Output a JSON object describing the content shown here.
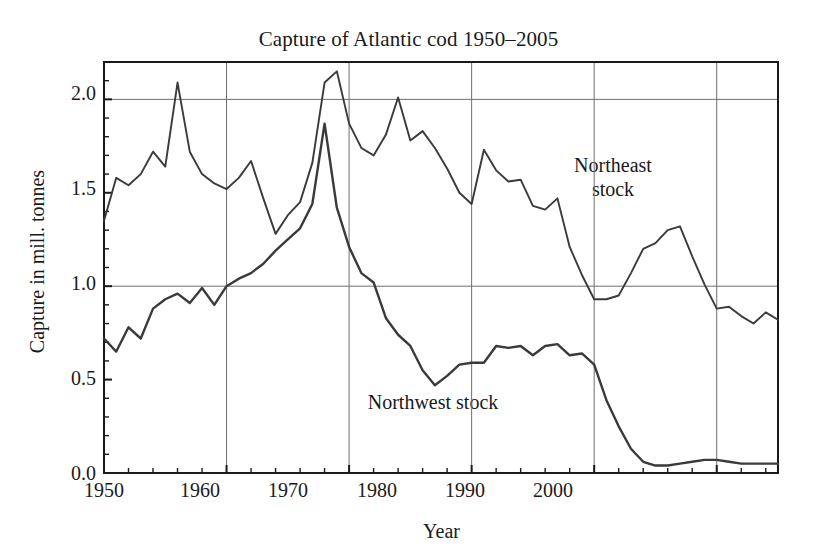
{
  "chart_data": {
    "type": "line",
    "title": "Capture of Atlantic cod 1950–2005",
    "xlabel": "Year",
    "ylabel": "Capture in mill. tonnes",
    "xlim": [
      1950,
      2005
    ],
    "ylim": [
      0.0,
      2.2
    ],
    "xticks": [
      1950,
      1960,
      1970,
      1980,
      1990,
      2000
    ],
    "xticklabels": [
      "1950",
      "1960",
      "1970",
      "1980",
      "1990",
      "2000"
    ],
    "yticks": [
      0.0,
      0.5,
      1.0,
      1.5,
      2.0
    ],
    "yticklabels": [
      "0.0",
      "0.5",
      "1.0",
      "1.5",
      "2.0"
    ],
    "grid": "major gridlines at x = 1960,1970,1980,1990,2000 and y = 1.0,2.0",
    "legend_position": "inline annotations on plot",
    "line_color": "#3a3a3a",
    "frame_color": "#1a1a1a",
    "x": [
      1950,
      1951,
      1952,
      1953,
      1954,
      1955,
      1956,
      1957,
      1958,
      1959,
      1960,
      1961,
      1962,
      1963,
      1964,
      1965,
      1966,
      1967,
      1968,
      1969,
      1970,
      1971,
      1972,
      1973,
      1974,
      1975,
      1976,
      1977,
      1978,
      1979,
      1980,
      1981,
      1982,
      1983,
      1984,
      1985,
      1986,
      1987,
      1988,
      1989,
      1990,
      1991,
      1992,
      1993,
      1994,
      1995,
      1996,
      1997,
      1998,
      1999,
      2000,
      2001,
      2002,
      2003,
      2004,
      2005
    ],
    "series": [
      {
        "name": "Northeast stock",
        "label_text": "Northeast\nstock",
        "values": [
          1.35,
          1.58,
          1.54,
          1.6,
          1.72,
          1.64,
          2.09,
          1.72,
          1.6,
          1.55,
          1.52,
          1.58,
          1.67,
          1.47,
          1.28,
          1.38,
          1.45,
          1.66,
          2.09,
          2.15,
          1.87,
          1.74,
          1.7,
          1.81,
          2.01,
          1.78,
          1.83,
          1.74,
          1.63,
          1.5,
          1.44,
          1.73,
          1.62,
          1.56,
          1.57,
          1.43,
          1.41,
          1.47,
          1.21,
          1.06,
          0.93,
          0.93,
          0.95,
          1.07,
          1.2,
          1.23,
          1.3,
          1.32,
          1.16,
          1.01,
          0.88,
          0.89,
          0.84,
          0.8,
          0.86,
          0.82
        ]
      },
      {
        "name": "Northwest stock",
        "label_text": "Northwest stock",
        "values": [
          0.72,
          0.65,
          0.78,
          0.72,
          0.88,
          0.93,
          0.96,
          0.91,
          0.99,
          0.9,
          1.0,
          1.04,
          1.07,
          1.12,
          1.19,
          1.25,
          1.31,
          1.44,
          1.87,
          1.42,
          1.21,
          1.07,
          1.02,
          0.83,
          0.74,
          0.68,
          0.55,
          0.47,
          0.52,
          0.58,
          0.59,
          0.59,
          0.68,
          0.67,
          0.68,
          0.63,
          0.68,
          0.69,
          0.63,
          0.64,
          0.58,
          0.39,
          0.25,
          0.13,
          0.06,
          0.04,
          0.04,
          0.05,
          0.06,
          0.07,
          0.07,
          0.06,
          0.05,
          0.05,
          0.05,
          0.05
        ]
      }
    ]
  },
  "axes": {
    "x_tick_labels": [
      "1950",
      "1960",
      "1970",
      "1980",
      "1990",
      "2000"
    ],
    "y_tick_labels": [
      "0.0",
      "0.5",
      "1.0",
      "1.5",
      "2.0"
    ],
    "x_axis_title": "Year",
    "y_axis_title": "Capture in mill. tonnes"
  },
  "title": "Capture of Atlantic cod 1950–2005",
  "annotations": {
    "northeast": "Northeast\nstock",
    "northwest": "Northwest stock"
  }
}
